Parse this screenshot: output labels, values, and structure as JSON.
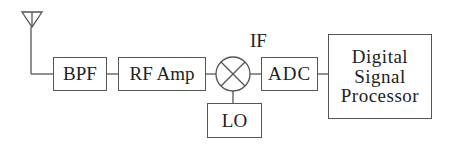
{
  "diagram": {
    "type": "block-diagram",
    "nodes": {
      "antenna": {
        "label": "",
        "icon": "antenna-icon"
      },
      "bpf": {
        "label": "BPF"
      },
      "rf_amp": {
        "label": "RF Amp"
      },
      "mixer": {
        "label": "",
        "icon": "mixer-icon"
      },
      "lo": {
        "label": "LO"
      },
      "adc": {
        "label": "ADC"
      },
      "dsp": {
        "lines": [
          "Digital",
          "Signal",
          "Processor"
        ]
      }
    },
    "if_label": "IF",
    "edges": [
      [
        "antenna",
        "bpf"
      ],
      [
        "bpf",
        "rf_amp"
      ],
      [
        "rf_amp",
        "mixer"
      ],
      [
        "lo",
        "mixer"
      ],
      [
        "mixer",
        "adc"
      ],
      [
        "adc",
        "dsp"
      ]
    ],
    "line_color": "#555555"
  }
}
